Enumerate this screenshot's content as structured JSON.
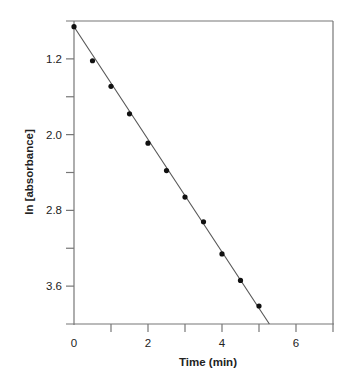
{
  "chart_data": {
    "type": "scatter",
    "title": "",
    "xlabel": "Time (min)",
    "ylabel": "ln [absorbance]",
    "xlim": [
      0,
      7
    ],
    "ylim": [
      0.8,
      4.0
    ],
    "y_inverted": true,
    "grid": false,
    "legend": null,
    "x_ticks": [
      0,
      1,
      2,
      3,
      4,
      5,
      6,
      7
    ],
    "x_tick_labels": [
      "0",
      "",
      "2",
      "",
      "4",
      "",
      "6",
      ""
    ],
    "y_ticks": [
      0.8,
      1.2,
      1.6,
      2.0,
      2.4,
      2.8,
      3.2,
      3.6,
      4.0
    ],
    "y_tick_labels": [
      "",
      "1.2",
      "",
      "2.0",
      "",
      "2.8",
      "",
      "3.6",
      ""
    ],
    "series": [
      {
        "name": "data",
        "type": "scatter",
        "x": [
          0,
          0.5,
          1.0,
          1.5,
          2.0,
          2.5,
          3.0,
          3.5,
          4.0,
          4.5,
          5.0
        ],
        "y": [
          0.86,
          1.22,
          1.49,
          1.78,
          2.09,
          2.38,
          2.66,
          2.92,
          3.26,
          3.54,
          3.81
        ]
      },
      {
        "name": "linear fit",
        "type": "line",
        "x": [
          0,
          5.28
        ],
        "y": [
          0.86,
          4.0
        ]
      }
    ]
  },
  "colors": {
    "axis": "#777777",
    "points": "#111111",
    "fit_line": "#555555",
    "text": "#222222"
  }
}
